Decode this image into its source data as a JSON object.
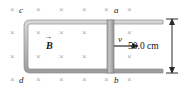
{
  "figure": {
    "type": "physics-diagram",
    "labels": {
      "corner_c": "c",
      "corner_a": "a",
      "corner_d": "d",
      "corner_b": "b",
      "field": "B",
      "field_vector_accent": "→",
      "velocity": "v",
      "dimension": "50.0 cm"
    },
    "field": {
      "direction": "into-page",
      "marker_glyph": "×",
      "marker_color": "#a9a9ad",
      "rows": [
        10,
        33,
        57,
        80
      ],
      "columns": [
        12,
        40,
        63,
        86,
        109,
        132,
        158
      ]
    },
    "colors": {
      "rail": "#b8b8b8",
      "rail_edge": "#8c8c8c",
      "bar": "#a8a8a8",
      "arrow": "#2b2b2b",
      "background": "#ffffff",
      "text": "#111111"
    },
    "geometry": {
      "rail_left_x": 24,
      "rail_top_y": 20,
      "rail_bottom_y": 72,
      "rail_right_x": 163,
      "bar_x": 107,
      "bar_width": 7,
      "dimension_arrow_x": 172,
      "velocity_arrow_y": 46
    }
  }
}
